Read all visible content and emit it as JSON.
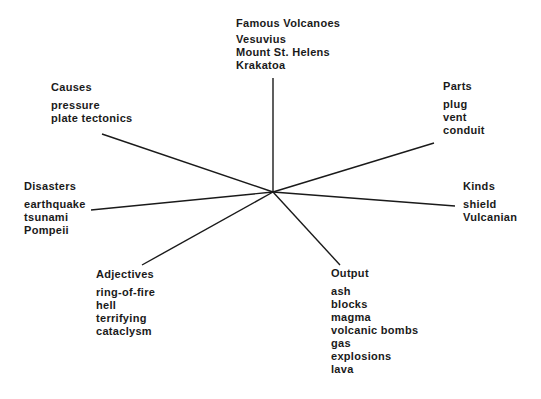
{
  "diagram": {
    "type": "semantic-map",
    "center": {
      "x": 273,
      "y": 192
    },
    "line_color": "#1a1a1a",
    "branches": [
      {
        "id": "famous",
        "title": "Famous Volcanoes",
        "items": [
          "Vesuvius",
          "Mount St. Helens",
          "Krakatoa"
        ],
        "end": {
          "x": 273,
          "y": 78
        }
      },
      {
        "id": "causes",
        "title": "Causes",
        "items": [
          "pressure",
          "plate tectonics"
        ],
        "end": {
          "x": 102,
          "y": 134
        }
      },
      {
        "id": "parts",
        "title": "Parts",
        "items": [
          "plug",
          "vent",
          "conduit"
        ],
        "end": {
          "x": 434,
          "y": 143
        }
      },
      {
        "id": "disasters",
        "title": "Disasters",
        "items": [
          "earthquake",
          "tsunami",
          "Pompeii"
        ],
        "end": {
          "x": 91,
          "y": 210
        }
      },
      {
        "id": "kinds",
        "title": "Kinds",
        "items": [
          "shield",
          "Vulcanian"
        ],
        "end": {
          "x": 455,
          "y": 206
        }
      },
      {
        "id": "adjectives",
        "title": "Adjectives",
        "items": [
          "ring-of-fire",
          "hell",
          "terrifying",
          "cataclysm"
        ],
        "end": {
          "x": 142,
          "y": 265
        }
      },
      {
        "id": "output",
        "title": "Output",
        "items": [
          "ash",
          "blocks",
          "magma",
          "volcanic bombs",
          "gas",
          "explosions",
          "lava"
        ],
        "end": {
          "x": 340,
          "y": 265
        }
      }
    ]
  }
}
